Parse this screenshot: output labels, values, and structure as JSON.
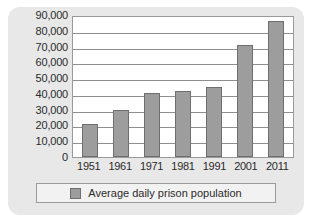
{
  "chart_data": {
    "type": "bar",
    "title": "",
    "subtitle": "",
    "xlabel": "",
    "ylabel": "",
    "categories": [
      "1951",
      "1961",
      "1971",
      "1981",
      "1991",
      "2001",
      "2011"
    ],
    "values": [
      21000,
      29500,
      40500,
      42000,
      44500,
      71000,
      86500
    ],
    "series": [
      {
        "name": "Average daily prison population",
        "values": [
          21000,
          29500,
          40500,
          42000,
          44500,
          71000,
          86500
        ],
        "color": "#9d9d9d"
      }
    ],
    "ylim": [
      0,
      90000
    ],
    "ytick_values": [
      0,
      10000,
      20000,
      30000,
      40000,
      50000,
      60000,
      70000,
      80000,
      90000
    ],
    "ytick_labels": [
      "0",
      "10,000",
      "20,000",
      "30,000",
      "40,000",
      "50,000",
      "60,000",
      "70,000",
      "80,000",
      "90,000"
    ],
    "grid": "horizontal",
    "legend_position": "bottom",
    "legend_entries": [
      "Average daily prison population"
    ]
  },
  "legend": {
    "label": "Average daily prison population"
  },
  "colors": {
    "bar_fill": "#9d9d9d",
    "bar_border": "#6f6f6f",
    "card_background": "#e8e8e8",
    "plot_background": "#ffffff",
    "gridline": "#8e8e8e",
    "text": "#2b2b2b"
  }
}
